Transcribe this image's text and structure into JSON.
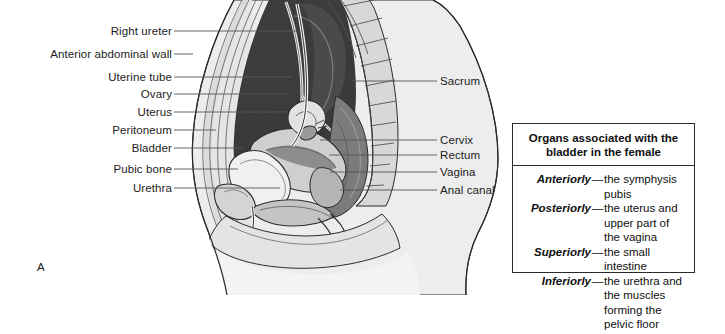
{
  "figure": {
    "panel_letter": "A"
  },
  "labels_left": [
    {
      "text": "Right ureter",
      "y": 25,
      "line_y": 31,
      "line_x2": 297
    },
    {
      "text": "Anterior abdominal wall",
      "y": 48,
      "line_y": 54,
      "line_x2": 193
    },
    {
      "text": "Uterine tube",
      "y": 71,
      "line_y": 77,
      "line_x2": 292
    },
    {
      "text": "Ovary",
      "y": 88,
      "line_y": 94,
      "line_x2": 289
    },
    {
      "text": "Uterus",
      "y": 106,
      "line_y": 112,
      "line_x2": 288
    },
    {
      "text": "Peritoneum",
      "y": 124,
      "line_y": 130,
      "line_x2": 216
    },
    {
      "text": "Bladder",
      "y": 142,
      "line_y": 148,
      "line_x2": 243
    },
    {
      "text": "Pubic bone",
      "y": 163,
      "line_y": 169,
      "line_x2": 238
    },
    {
      "text": "Urethra",
      "y": 182,
      "line_y": 188,
      "line_x2": 280
    }
  ],
  "labels_right": [
    {
      "text": "Sacrum",
      "y": 75,
      "line_y": 81,
      "line_x1": 352
    },
    {
      "text": "Cervix",
      "y": 134,
      "line_y": 140,
      "line_x1": 320
    },
    {
      "text": "Rectum",
      "y": 149,
      "line_y": 155,
      "line_x1": 329
    },
    {
      "text": "Vagina",
      "y": 166,
      "line_y": 172,
      "line_x1": 330
    },
    {
      "text": "Anal canal",
      "y": 184,
      "line_y": 190,
      "line_x1": 340
    }
  ],
  "legend": {
    "title_line_1": "Organs associated with the",
    "title_line_2": "bladder in the female",
    "dash": "—",
    "rows": [
      {
        "term": "Anteriorly",
        "description": "the symphysis pubis"
      },
      {
        "term": "Posteriorly",
        "description": "the uterus and upper part of the vagina"
      },
      {
        "term": "Superiorly",
        "description": "the small intestine"
      },
      {
        "term": "Inferiorly",
        "description": "the urethra and the muscles forming the pelvic floor"
      }
    ]
  },
  "colors": {
    "background": "#ffffff",
    "outline": "#2b2b2b",
    "leader_line": "#555555",
    "cavity_dark": "#3a3a3a",
    "cavity_mid": "#6f6f6f",
    "organ_mid": "#8d8d8d",
    "organ_light": "#c9c9c9",
    "tissue_pale": "#dcdcdc",
    "skin_pale": "#ededed",
    "bone_light": "#d4d4d4",
    "box_border": "#2a2a2a",
    "text": "#1c1c1c"
  }
}
